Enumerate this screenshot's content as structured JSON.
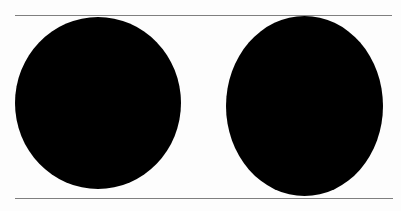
{
  "figure": {
    "background_color": "#fdfdfd",
    "rules": {
      "color": "#7f7f7f",
      "items": [
        {
          "position": "top"
        },
        {
          "position": "bottom"
        }
      ]
    },
    "shapes": [
      {
        "type": "ellipse",
        "fill": "#000000",
        "position": "left"
      },
      {
        "type": "ellipse",
        "fill": "#000000",
        "position": "right"
      }
    ]
  }
}
